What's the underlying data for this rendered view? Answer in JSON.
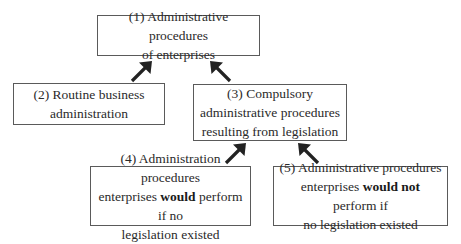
{
  "diagram": {
    "type": "hierarchy",
    "nodes": [
      {
        "id": 1,
        "line1": "(1) Administrative procedures",
        "line2": "of enterprises"
      },
      {
        "id": 2,
        "line1": "(2) Routine business",
        "line2": "administration"
      },
      {
        "id": 3,
        "line1": "(3) Compulsory",
        "line2": "administrative procedures",
        "line3": "resulting from legislation"
      },
      {
        "id": 4,
        "line1": "(4) Administration procedures",
        "line2_pre": "enterprises ",
        "line2_bold": "would",
        "line2_post": " perform if no",
        "line3": "legislation existed"
      },
      {
        "id": 5,
        "line1": "(5) Administrative procedures",
        "line2_pre": "enterprises ",
        "line2_bold": "would not",
        "line2_post": " perform if",
        "line3": "no legislation existed"
      }
    ],
    "edges": [
      {
        "from": 2,
        "to": 1,
        "direction": "north-east"
      },
      {
        "from": 3,
        "to": 1,
        "direction": "north-west"
      },
      {
        "from": 4,
        "to": 3,
        "direction": "north-east"
      },
      {
        "from": 5,
        "to": 3,
        "direction": "north-west"
      }
    ],
    "colors": {
      "border": "#5a5a5a",
      "arrow": "#222222",
      "text": "#2a2a2a"
    }
  }
}
